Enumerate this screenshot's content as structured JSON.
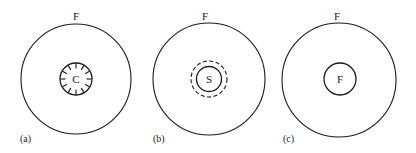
{
  "panels": [
    {
      "id": "a",
      "label": "(a)",
      "outer_label": "F",
      "inner_label": "C",
      "inner_style": "solid-with-radial-ticks"
    },
    {
      "id": "b",
      "label": "(b)",
      "outer_label": "F",
      "inner_label": "S",
      "inner_style": "solid-with-dashed-ring"
    },
    {
      "id": "c",
      "label": "(c)",
      "outer_label": "F",
      "inner_label": "F",
      "inner_style": "solid"
    }
  ],
  "colors": {
    "stroke": "#1a1a1a",
    "background": "#ffffff"
  }
}
